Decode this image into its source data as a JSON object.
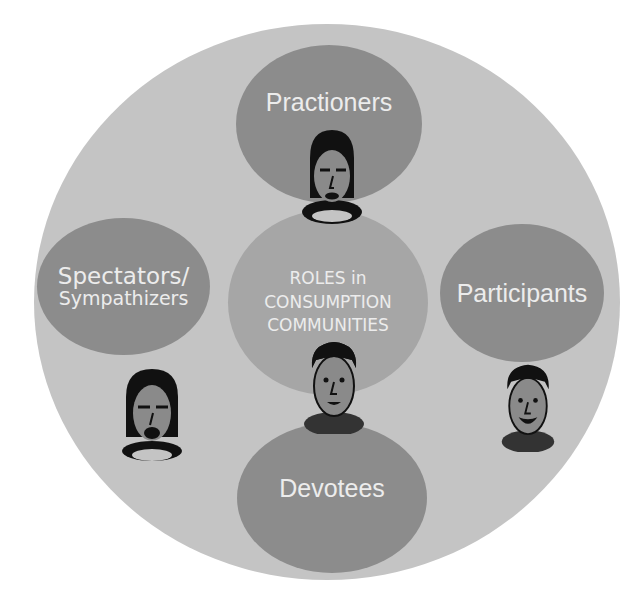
{
  "diagram": {
    "title": "ROLES in CONSUMPTION COMMUNITIES",
    "center": {
      "line1": "ROLES in",
      "line2": "CONSUMPTION",
      "line3": "COMMUNITIES"
    },
    "roles": [
      {
        "id": "practioners",
        "label": "Practioners"
      },
      {
        "id": "spectators",
        "line1": "Spectators/",
        "line2": "Sympathizers"
      },
      {
        "id": "participants",
        "label": "Participants"
      },
      {
        "id": "devotees",
        "label": "Devotees"
      }
    ],
    "colors": {
      "outer": "#c4c4c4",
      "role_bubble": "#8c8c8c",
      "center_bubble": "#a6a6a6",
      "text": "#ececec"
    }
  }
}
